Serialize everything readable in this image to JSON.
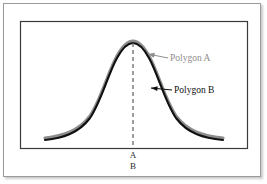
{
  "figure": {
    "name": "overlapping-frequency-polygons",
    "background_color": "#ffffff",
    "outer_border_color": "#9a9a9a",
    "plot_frame_color": "#3a3a3a"
  },
  "annotations": {
    "polygon_a": {
      "label": "Polygon A",
      "color": "#8d8d8d",
      "leader_from_x": 168,
      "leader_from_y": 58,
      "leader_to_x": 148,
      "leader_to_y": 54,
      "text_x": 170,
      "text_y": 61
    },
    "polygon_b": {
      "label": "Polygon B",
      "color": "#101010",
      "leader_from_x": 172,
      "leader_from_y": 90,
      "leader_to_x": 151,
      "leader_to_y": 88,
      "text_x": 174,
      "text_y": 93
    }
  },
  "axis_marks": {
    "mean_line_x": 133,
    "labels": [
      {
        "text": "A",
        "x": 133,
        "y": 158
      },
      {
        "text": "B",
        "x": 133,
        "y": 169
      }
    ]
  },
  "chart_data": {
    "type": "line",
    "title": "",
    "xlabel": "",
    "ylabel": "",
    "grid": false,
    "legend_position": "inline-annotation",
    "axis": {
      "x_min": 20,
      "x_max": 247,
      "baseline_y": 148,
      "top_y": 21
    },
    "series": [
      {
        "name": "Polygon A",
        "color": "#8d8d8d",
        "stroke_width": 3.2,
        "path": "M 45 138 C 62 136, 78 132, 90 116 C 101 100, 108 72, 117 56 C 123 45, 128 41, 133 41 C 138 41, 143 45, 149 56 C 158 72, 165 100, 176 116 C 188 132, 204 136, 223 138"
      },
      {
        "name": "Polygon B",
        "color": "#101010",
        "stroke_width": 2.1,
        "path": "M 45 140 C 62 138, 78 134, 90 118 C 101 102, 108 74, 117 58 C 123 47, 128 43, 133 43 C 138 43, 143 47, 149 58 C 158 74, 165 102, 176 118 C 188 134, 204 138, 223 140"
      }
    ],
    "mean_marker": {
      "type": "dashed-vertical",
      "x": 133,
      "y_top": 43,
      "y_bottom": 148,
      "color": "#6a6a6a",
      "labels": [
        "A",
        "B"
      ]
    }
  }
}
